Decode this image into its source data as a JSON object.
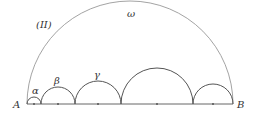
{
  "diagram": {
    "figure_label": "(II)",
    "points": {
      "A": {
        "label": "A",
        "x": 27,
        "y": 104
      },
      "B": {
        "label": "B",
        "x": 233,
        "y": 104
      }
    },
    "big_arc": {
      "label": "ω",
      "cx": 130,
      "cy": 104,
      "r": 103
    },
    "small_arcs": [
      {
        "label": "α",
        "x1": 27,
        "x2": 41
      },
      {
        "label": "β",
        "x1": 41,
        "x2": 75
      },
      {
        "label": "γ",
        "x1": 75,
        "x2": 121
      },
      {
        "label": "",
        "x1": 121,
        "x2": 193
      },
      {
        "label": "",
        "x1": 193,
        "x2": 233
      }
    ],
    "colors": {
      "stroke": "#555555",
      "light_stroke": "#999999"
    }
  }
}
